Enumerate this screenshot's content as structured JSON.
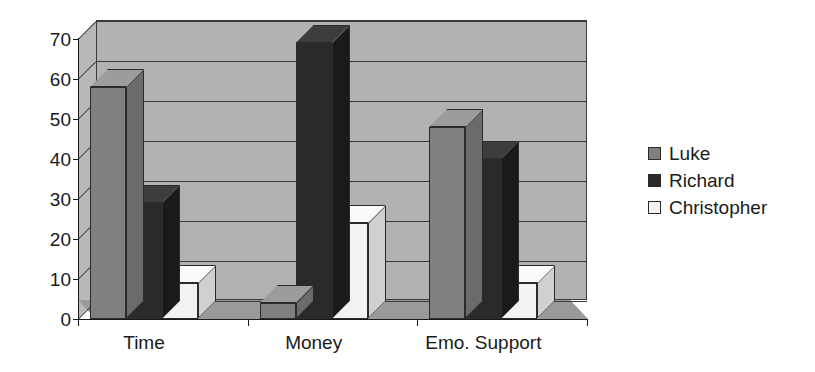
{
  "chart_data": {
    "type": "bar",
    "title": "",
    "subtitle": "",
    "xlabel": "",
    "ylabel": "",
    "categories": [
      "Time",
      "Money",
      "Emo. Support"
    ],
    "series": [
      {
        "name": "Luke",
        "values": [
          58,
          4,
          48
        ],
        "color": "#808080"
      },
      {
        "name": "Richard",
        "values": [
          29,
          69,
          40
        ],
        "color": "#2a2a2a"
      },
      {
        "name": "Christopher",
        "values": [
          9,
          24,
          9
        ],
        "color": "#f2f2f2"
      }
    ],
    "ylim": [
      0,
      70
    ],
    "yticks": [
      0,
      10,
      20,
      30,
      40,
      50,
      60,
      70
    ],
    "ytick_labels": [
      "0",
      "10",
      "20",
      "30",
      "40",
      "50",
      "60",
      "70"
    ],
    "grid": true,
    "grid_axis": "y",
    "legend_position": "right",
    "style": "3d-column",
    "annotations": []
  },
  "legend": {
    "items": [
      {
        "label": "Luke",
        "swatch_color": "#808080"
      },
      {
        "label": "Richard",
        "swatch_color": "#2a2a2a"
      },
      {
        "label": "Christopher",
        "swatch_color": "#f2f2f2"
      }
    ]
  },
  "colors": {
    "background": "#ffffff",
    "wall": "#b2b2b2",
    "side_wall": "#b8b8b8",
    "floor": "#9a9a9a",
    "grid": "#3a3a3a",
    "axis": "#1a1a1a",
    "text": "#1a1a1a",
    "series_luke": "#808080",
    "series_richard": "#2a2a2a",
    "series_christopher": "#f2f2f2",
    "series_luke_side": "#6b6b6b",
    "series_luke_top": "#9c9c9c",
    "series_richard_side": "#1a1a1a",
    "series_richard_top": "#3d3d3d",
    "series_christopher_side": "#d0d0d0",
    "series_christopher_top": "#fafafa"
  }
}
